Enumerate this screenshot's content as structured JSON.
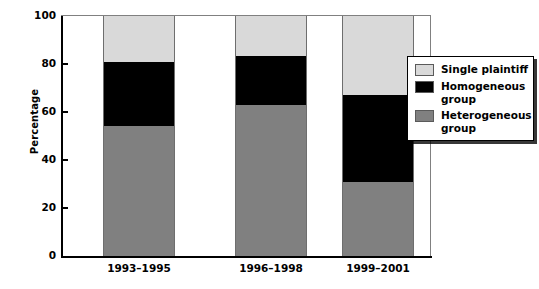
{
  "chart_data": {
    "type": "bar",
    "subtype": "stacked-bar-100",
    "title": "",
    "xlabel": "",
    "ylabel": "Percentage",
    "ylim": [
      0,
      100
    ],
    "yticks": [
      0,
      20,
      40,
      60,
      80,
      100
    ],
    "ytick_labels": [
      "0",
      "20",
      "40",
      "60",
      "80",
      "100"
    ],
    "grid": false,
    "legend_position": "right-inside",
    "categories": [
      "1993–1995",
      "1996–1998",
      "1999–2001"
    ],
    "series": [
      {
        "name": "Heterogeneous group",
        "color": "#808080",
        "values": [
          54,
          63,
          31
        ]
      },
      {
        "name": "Homogeneous group",
        "color": "#000000",
        "values": [
          27,
          20.5,
          36
        ]
      },
      {
        "name": "Single plaintiff",
        "color": "#d9d9d9",
        "values": [
          19,
          16.5,
          33
        ]
      }
    ],
    "stack_order_bottom_to_top": [
      "Heterogeneous group",
      "Homogeneous group",
      "Single plaintiff"
    ],
    "cumulative_tops": {
      "1993–1995": {
        "Heterogeneous group": 54,
        "Homogeneous group": 81,
        "Single plaintiff": 100
      },
      "1996–1998": {
        "Heterogeneous group": 63,
        "Homogeneous group": 83.5,
        "Single plaintiff": 100
      },
      "1999–2001": {
        "Heterogeneous group": 31,
        "Homogeneous group": 67,
        "Single plaintiff": 100
      }
    }
  },
  "axes": {
    "y_title": "Percentage",
    "y_ticks": [
      {
        "value": 100,
        "label": "100"
      },
      {
        "value": 80,
        "label": "80"
      },
      {
        "value": 60,
        "label": "60"
      },
      {
        "value": 40,
        "label": "40"
      },
      {
        "value": 20,
        "label": "20"
      },
      {
        "value": 0,
        "label": "0"
      }
    ],
    "x_ticks": [
      {
        "label": "1993–1995"
      },
      {
        "label": "1996–1998"
      },
      {
        "label": "1999–2001"
      }
    ]
  },
  "legend": {
    "items": [
      {
        "label": "Single plaintiff",
        "color": "#d9d9d9"
      },
      {
        "label": "Homogeneous group",
        "color": "#000000"
      },
      {
        "label": "Heterogeneous group",
        "color": "#808080"
      }
    ]
  },
  "colors": {
    "single_plaintiff": "#d9d9d9",
    "homogeneous_group": "#000000",
    "heterogeneous_group": "#808080",
    "axis": "#000000",
    "frame": "#808080",
    "background": "#ffffff"
  }
}
